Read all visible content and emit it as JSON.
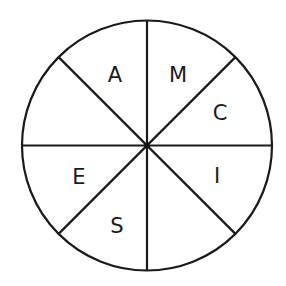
{
  "diagram": {
    "type": "letter-wheel",
    "sector_count": 8,
    "colors": {
      "stroke": "#1a1a1a",
      "background": "#ffffff",
      "text": "#1a1a1a"
    },
    "sectors": [
      {
        "position": "top-right-upper",
        "letter": "M"
      },
      {
        "position": "top-right-lower",
        "letter": "C"
      },
      {
        "position": "bottom-right-upper",
        "letter": "I"
      },
      {
        "position": "bottom-right-lower",
        "letter": ""
      },
      {
        "position": "bottom-left-lower",
        "letter": "S"
      },
      {
        "position": "bottom-left-upper",
        "letter": "E"
      },
      {
        "position": "top-left-lower",
        "letter": ""
      },
      {
        "position": "top-left-upper",
        "letter": "A"
      }
    ],
    "letters": {
      "a": "A",
      "m": "M",
      "c": "C",
      "i": "I",
      "s": "S",
      "e": "E"
    }
  }
}
